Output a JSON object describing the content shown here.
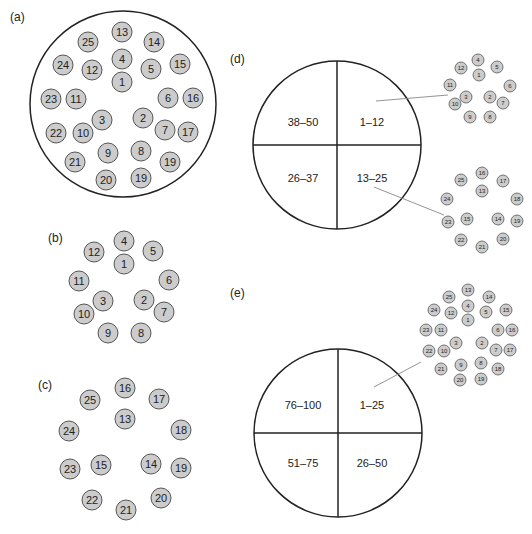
{
  "colors": {
    "circle_fill": "#cccccc",
    "circle_stroke": "#555555",
    "outline": "#222222",
    "connector": "#888888",
    "text": "#222222"
  },
  "panels": {
    "a": {
      "label": "(a)",
      "container": {
        "cx": 123,
        "cy": 104,
        "r": 93
      },
      "circle_r": 10,
      "circles": [
        {
          "n": "13",
          "x": 122,
          "y": 32
        },
        {
          "n": "25",
          "x": 88,
          "y": 42
        },
        {
          "n": "14",
          "x": 154,
          "y": 42
        },
        {
          "n": "4",
          "x": 122,
          "y": 59
        },
        {
          "n": "24",
          "x": 63,
          "y": 65
        },
        {
          "n": "12",
          "x": 92,
          "y": 70
        },
        {
          "n": "5",
          "x": 151,
          "y": 69
        },
        {
          "n": "15",
          "x": 180,
          "y": 64
        },
        {
          "n": "1",
          "x": 122,
          "y": 82
        },
        {
          "n": "23",
          "x": 51,
          "y": 99
        },
        {
          "n": "11",
          "x": 76,
          "y": 99
        },
        {
          "n": "6",
          "x": 168,
          "y": 98
        },
        {
          "n": "16",
          "x": 193,
          "y": 98
        },
        {
          "n": "3",
          "x": 102,
          "y": 120
        },
        {
          "n": "2",
          "x": 143,
          "y": 118
        },
        {
          "n": "22",
          "x": 56,
          "y": 133
        },
        {
          "n": "10",
          "x": 83,
          "y": 133
        },
        {
          "n": "7",
          "x": 165,
          "y": 130
        },
        {
          "n": "17",
          "x": 188,
          "y": 132
        },
        {
          "n": "21",
          "x": 75,
          "y": 162
        },
        {
          "n": "9",
          "x": 108,
          "y": 153
        },
        {
          "n": "8",
          "x": 141,
          "y": 151
        },
        {
          "n": "19",
          "x": 170,
          "y": 162
        },
        {
          "n": "20",
          "x": 106,
          "y": 180
        },
        {
          "n": "19",
          "x": 141,
          "y": 178
        }
      ]
    },
    "b": {
      "label": "(b)",
      "circle_r": 10,
      "circles": [
        {
          "n": "4",
          "x": 124,
          "y": 241
        },
        {
          "n": "12",
          "x": 94,
          "y": 252
        },
        {
          "n": "5",
          "x": 153,
          "y": 251
        },
        {
          "n": "1",
          "x": 124,
          "y": 264
        },
        {
          "n": "11",
          "x": 79,
          "y": 281
        },
        {
          "n": "6",
          "x": 169,
          "y": 280
        },
        {
          "n": "3",
          "x": 103,
          "y": 301
        },
        {
          "n": "2",
          "x": 144,
          "y": 300
        },
        {
          "n": "10",
          "x": 84,
          "y": 314
        },
        {
          "n": "7",
          "x": 164,
          "y": 312
        },
        {
          "n": "9",
          "x": 108,
          "y": 333
        },
        {
          "n": "8",
          "x": 141,
          "y": 333
        }
      ]
    },
    "c": {
      "label": "(c)",
      "circle_r": 10,
      "circles": [
        {
          "n": "16",
          "x": 125,
          "y": 388
        },
        {
          "n": "25",
          "x": 90,
          "y": 400
        },
        {
          "n": "17",
          "x": 159,
          "y": 399
        },
        {
          "n": "13",
          "x": 125,
          "y": 419
        },
        {
          "n": "24",
          "x": 69,
          "y": 431
        },
        {
          "n": "18",
          "x": 181,
          "y": 430
        },
        {
          "n": "15",
          "x": 101,
          "y": 465
        },
        {
          "n": "14",
          "x": 151,
          "y": 464
        },
        {
          "n": "23",
          "x": 70,
          "y": 469
        },
        {
          "n": "19",
          "x": 181,
          "y": 468
        },
        {
          "n": "22",
          "x": 92,
          "y": 500
        },
        {
          "n": "20",
          "x": 161,
          "y": 498
        },
        {
          "n": "21",
          "x": 126,
          "y": 510
        }
      ]
    },
    "d": {
      "label": "(d)",
      "pie": {
        "cx": 337,
        "cy": 145,
        "r": 84
      },
      "quadrants": [
        {
          "label": "38–50",
          "x": 303,
          "y": 122
        },
        {
          "label": "1–12",
          "x": 372,
          "y": 122
        },
        {
          "label": "26–37",
          "x": 303,
          "y": 178
        },
        {
          "label": "13–25",
          "x": 372,
          "y": 178
        }
      ],
      "connectors": [
        {
          "x1": 376,
          "y1": 101,
          "x2": 448,
          "y2": 95
        },
        {
          "x1": 374,
          "y1": 187,
          "x2": 444,
          "y2": 215
        }
      ],
      "circle_r": 6,
      "clusters": [
        [
          {
            "n": "4",
            "x": 478,
            "y": 60
          },
          {
            "n": "12",
            "x": 461,
            "y": 68
          },
          {
            "n": "5",
            "x": 497,
            "y": 67
          },
          {
            "n": "1",
            "x": 479,
            "y": 75
          },
          {
            "n": "11",
            "x": 450,
            "y": 85
          },
          {
            "n": "6",
            "x": 510,
            "y": 86
          },
          {
            "n": "3",
            "x": 466,
            "y": 97
          },
          {
            "n": "2",
            "x": 490,
            "y": 97
          },
          {
            "n": "10",
            "x": 455,
            "y": 104
          },
          {
            "n": "7",
            "x": 503,
            "y": 103
          },
          {
            "n": "9",
            "x": 470,
            "y": 117
          },
          {
            "n": "8",
            "x": 490,
            "y": 117
          }
        ],
        [
          {
            "n": "16",
            "x": 482,
            "y": 173
          },
          {
            "n": "25",
            "x": 461,
            "y": 180
          },
          {
            "n": "17",
            "x": 503,
            "y": 181
          },
          {
            "n": "13",
            "x": 482,
            "y": 191
          },
          {
            "n": "24",
            "x": 447,
            "y": 199
          },
          {
            "n": "18",
            "x": 517,
            "y": 199
          },
          {
            "n": "15",
            "x": 467,
            "y": 219
          },
          {
            "n": "14",
            "x": 498,
            "y": 219
          },
          {
            "n": "23",
            "x": 448,
            "y": 222
          },
          {
            "n": "19",
            "x": 517,
            "y": 221
          },
          {
            "n": "22",
            "x": 461,
            "y": 240
          },
          {
            "n": "20",
            "x": 503,
            "y": 239
          },
          {
            "n": "21",
            "x": 482,
            "y": 247
          }
        ]
      ]
    },
    "e": {
      "label": "(e)",
      "pie": {
        "cx": 338,
        "cy": 433,
        "r": 84
      },
      "quadrants": [
        {
          "label": "76–100",
          "x": 303,
          "y": 405
        },
        {
          "label": "1–25",
          "x": 372,
          "y": 405
        },
        {
          "label": "51–75",
          "x": 303,
          "y": 463
        },
        {
          "label": "26–50",
          "x": 372,
          "y": 463
        }
      ],
      "connectors": [
        {
          "x1": 374,
          "y1": 387,
          "x2": 421,
          "y2": 362
        }
      ],
      "circle_r": 6,
      "clusters": [
        [
          {
            "n": "13",
            "x": 468,
            "y": 290
          },
          {
            "n": "25",
            "x": 449,
            "y": 297
          },
          {
            "n": "14",
            "x": 489,
            "y": 297
          },
          {
            "n": "4",
            "x": 468,
            "y": 306
          },
          {
            "n": "24",
            "x": 434,
            "y": 310
          },
          {
            "n": "12",
            "x": 451,
            "y": 313
          },
          {
            "n": "5",
            "x": 486,
            "y": 312
          },
          {
            "n": "15",
            "x": 506,
            "y": 310
          },
          {
            "n": "1",
            "x": 468,
            "y": 320
          },
          {
            "n": "23",
            "x": 426,
            "y": 330
          },
          {
            "n": "11",
            "x": 441,
            "y": 330
          },
          {
            "n": "6",
            "x": 498,
            "y": 330
          },
          {
            "n": "16",
            "x": 512,
            "y": 330
          },
          {
            "n": "3",
            "x": 456,
            "y": 343
          },
          {
            "n": "2",
            "x": 482,
            "y": 343
          },
          {
            "n": "22",
            "x": 429,
            "y": 351
          },
          {
            "n": "10",
            "x": 444,
            "y": 351
          },
          {
            "n": "7",
            "x": 496,
            "y": 350
          },
          {
            "n": "17",
            "x": 510,
            "y": 350
          },
          {
            "n": "21",
            "x": 441,
            "y": 369
          },
          {
            "n": "9",
            "x": 461,
            "y": 365
          },
          {
            "n": "8",
            "x": 481,
            "y": 363
          },
          {
            "n": "18",
            "x": 498,
            "y": 369
          },
          {
            "n": "20",
            "x": 460,
            "y": 380
          },
          {
            "n": "19",
            "x": 481,
            "y": 379
          }
        ]
      ]
    }
  }
}
